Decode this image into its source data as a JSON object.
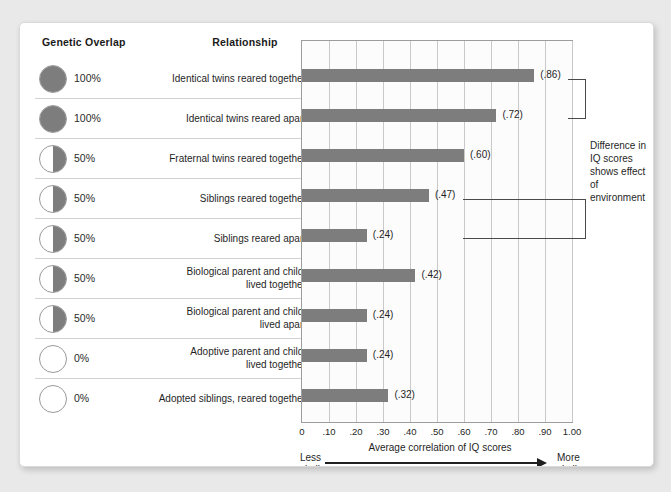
{
  "headers": {
    "genetic_overlap": "Genetic Overlap",
    "relationship": "Relationship"
  },
  "annotation": {
    "text": "Difference in IQ scores shows effect of environment"
  },
  "axis": {
    "title": "Average correlation of IQ scores",
    "left_label": "Less\nsimilar",
    "left_label_line1": "Less",
    "left_label_line2": "similar",
    "right_label_line1": "More",
    "right_label_line2": "similar",
    "ticks": [
      "0",
      ".10",
      ".20",
      ".30",
      ".40",
      ".50",
      ".60",
      ".70",
      ".80",
      ".90",
      "1.00"
    ]
  },
  "colors": {
    "bar": "#7d7d7d",
    "circle_fill": "#7d7d7d",
    "circle_stroke": "#9a9a9a",
    "grid": "#c9c9c9",
    "plot_border": "#9d9d9d",
    "page_background": "#e9e9e9",
    "card_background": "#ffffff",
    "text": "#1f1f1f",
    "bracket": "#4a4a4a"
  },
  "chart_data": {
    "type": "bar",
    "title": "",
    "xlabel": "Average correlation of IQ scores",
    "ylabel": "",
    "xlim": [
      0,
      1.0
    ],
    "grid": true,
    "orientation": "horizontal",
    "legend": "none",
    "categories": [
      "Identical twins reared together",
      "Identical twins reared apart",
      "Fraternal twins reared together",
      "Siblings reared together",
      "Siblings reared apart",
      "Biological parent and child, lived together",
      "Biological parent and child, lived apart",
      "Adoptive parent and child, lived together",
      "Adopted siblings, reared together"
    ],
    "values": [
      0.86,
      0.72,
      0.6,
      0.47,
      0.24,
      0.42,
      0.24,
      0.24,
      0.32
    ],
    "value_labels": [
      "(.86)",
      "(.72)",
      "(.60)",
      "(.47)",
      "(.24)",
      "(.42)",
      "(.24)",
      "(.24)",
      "(.32)"
    ],
    "genetic_overlap": [
      "100%",
      "100%",
      "50%",
      "50%",
      "50%",
      "50%",
      "50%",
      "0%",
      "0%"
    ],
    "annotations": [
      {
        "label": "Difference in IQ scores shows effect of environment",
        "connects_rows": [
          1,
          2
        ]
      },
      {
        "label": "Difference in IQ scores shows effect of environment",
        "connects_rows": [
          4,
          5
        ]
      }
    ]
  },
  "rows": [
    {
      "overlap": "100%",
      "overlap_type": "full",
      "relationship_line1": "Identical twins reared together",
      "relationship_line2": "",
      "value": 0.86,
      "value_label": "(.86)"
    },
    {
      "overlap": "100%",
      "overlap_type": "full",
      "relationship_line1": "Identical twins reared apart",
      "relationship_line2": "",
      "value": 0.72,
      "value_label": "(.72)"
    },
    {
      "overlap": "50%",
      "overlap_type": "half",
      "relationship_line1": "Fraternal twins reared together",
      "relationship_line2": "",
      "value": 0.6,
      "value_label": "(.60)"
    },
    {
      "overlap": "50%",
      "overlap_type": "half",
      "relationship_line1": "Siblings reared together",
      "relationship_line2": "",
      "value": 0.47,
      "value_label": "(.47)"
    },
    {
      "overlap": "50%",
      "overlap_type": "half",
      "relationship_line1": "Siblings reared apart",
      "relationship_line2": "",
      "value": 0.24,
      "value_label": "(.24)"
    },
    {
      "overlap": "50%",
      "overlap_type": "half",
      "relationship_line1": "Biological parent and child,",
      "relationship_line2": "lived together",
      "value": 0.42,
      "value_label": "(.42)"
    },
    {
      "overlap": "50%",
      "overlap_type": "half",
      "relationship_line1": "Biological parent and child,",
      "relationship_line2": "lived apart",
      "value": 0.24,
      "value_label": "(.24)"
    },
    {
      "overlap": "0%",
      "overlap_type": "empty",
      "relationship_line1": "Adoptive parent and child,",
      "relationship_line2": "lived together",
      "value": 0.24,
      "value_label": "(.24)"
    },
    {
      "overlap": "0%",
      "overlap_type": "empty",
      "relationship_line1": "Adopted siblings, reared together",
      "relationship_line2": "",
      "value": 0.32,
      "value_label": "(.32)"
    }
  ]
}
